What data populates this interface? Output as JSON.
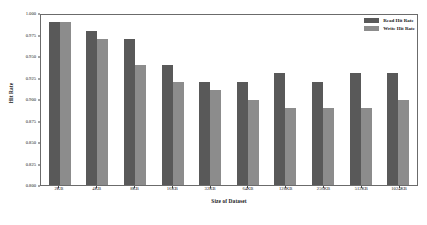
{
  "chart_data": {
    "type": "bar",
    "title": "",
    "xlabel": "Size of Dataset",
    "ylabel": "Hit Rate",
    "categories": [
      "2KB",
      "4KB",
      "8KB",
      "16KB",
      "32KB",
      "64KB",
      "128KB",
      "256KB",
      "512KB",
      "1024KB"
    ],
    "series": [
      {
        "name": "Read Hit Rate",
        "color": "#595959",
        "values": [
          0.99,
          0.979,
          0.97,
          0.94,
          0.92,
          0.92,
          0.93,
          0.92,
          0.93,
          0.93
        ]
      },
      {
        "name": "Write Hit Rate",
        "color": "#8c8c8c",
        "values": [
          0.99,
          0.97,
          0.94,
          0.92,
          0.911,
          0.899,
          0.889,
          0.889,
          0.889,
          0.899
        ]
      }
    ],
    "ylim": [
      0.8,
      1.0
    ],
    "yticks": [
      "0.800",
      "0.825",
      "0.850",
      "0.875",
      "0.900",
      "0.925",
      "0.950",
      "0.975",
      "1.000"
    ],
    "ytick_values": [
      0.8,
      0.825,
      0.85,
      0.875,
      0.9,
      0.925,
      0.95,
      0.975,
      1.0
    ],
    "grid": false,
    "legend_position": "upper right"
  }
}
